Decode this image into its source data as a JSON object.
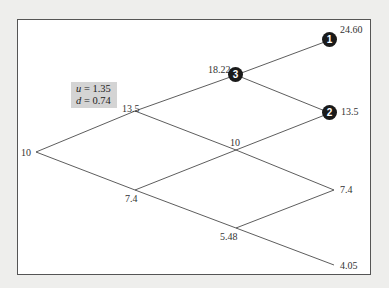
{
  "parameters": {
    "u_label": "u",
    "u_value": "= 1.35",
    "d_label": "d",
    "d_value": "= 0.74"
  },
  "tree": {
    "step0": {
      "price": "10"
    },
    "step1": {
      "up": "13.5",
      "down": "7.4"
    },
    "step2": {
      "upup": "18.22",
      "mid": "10",
      "downdown": "5.48"
    },
    "step3": {
      "uuu": "24.60",
      "uud": "13.5",
      "udd": "7.4",
      "ddd": "4.05"
    }
  },
  "markers": [
    {
      "number": "1"
    },
    {
      "number": "2"
    },
    {
      "number": "3"
    }
  ]
}
